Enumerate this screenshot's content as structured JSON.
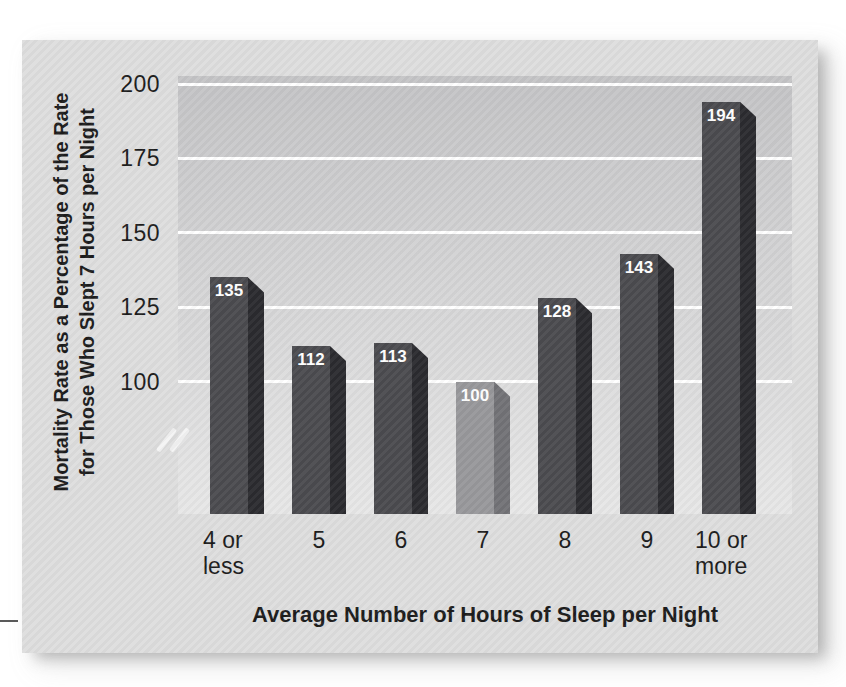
{
  "chart_data": {
    "type": "bar",
    "title": "",
    "categories": [
      "4 or less",
      "5",
      "6",
      "7",
      "8",
      "9",
      "10 or more"
    ],
    "category_lines": [
      [
        "4 or",
        "less"
      ],
      [
        "5"
      ],
      [
        "6"
      ],
      [
        "7"
      ],
      [
        "8"
      ],
      [
        "9"
      ],
      [
        "10 or",
        "more"
      ]
    ],
    "values": [
      135,
      112,
      113,
      100,
      128,
      143,
      194
    ],
    "highlight_index": 3,
    "highlight_category": "7",
    "xlabel": "Average Number of Hours of Sleep per Night",
    "ylabel": "Mortality Rate as a Percentage of the Rate for Those Who Slept 7 Hours per Night",
    "ylabel_line1": "Mortality Rate as a Percentage of the Rate",
    "ylabel_line2": "for Those Who Slept 7 Hours per Night",
    "yticks": [
      200,
      175,
      150,
      125,
      100
    ],
    "ymin": 100,
    "ymax": 200,
    "axis_break_below": 100,
    "grid": true,
    "legend": "none",
    "colors": {
      "bar_face": "#4b4b4f",
      "bar_side": "#2b2b2f",
      "highlight_face": "#98989b",
      "highlight_side": "#727276",
      "value_label": "#ffffff",
      "grid_line": "#ffffff",
      "figure_bg": "#dedede",
      "plot_bg_top": "#c4c4c6",
      "plot_bg_bottom": "#e7e7e7",
      "text": "#1c1c1c",
      "margin_line": "#5a5a5a"
    }
  }
}
